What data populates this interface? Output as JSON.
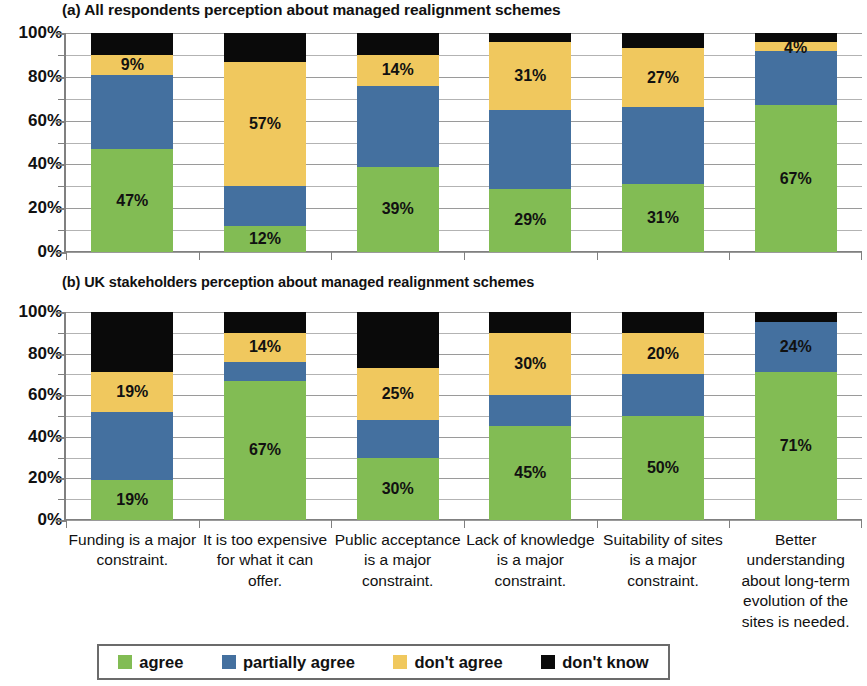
{
  "figure": {
    "panels": [
      {
        "id": "a",
        "title": "(a) All respondents perception about managed realignment schemes"
      },
      {
        "id": "b",
        "title": "(b) UK stakeholders perception about managed realignment schemes"
      }
    ]
  },
  "y_axis": {
    "ticks": [
      "0%",
      "20%",
      "40%",
      "60%",
      "80%",
      "100%"
    ],
    "minor_step": 10,
    "min": 0,
    "max": 100
  },
  "legend": {
    "position": "bottom",
    "items": [
      {
        "label": "agree",
        "color": "#82BC54",
        "key": "agree"
      },
      {
        "label": "partially agree",
        "color": "#44709F",
        "key": "partially_agree"
      },
      {
        "label": "don't agree",
        "color": "#F0C85E",
        "key": "dont_agree"
      },
      {
        "label": "don't know",
        "color": "#0A0A0A",
        "key": "dont_know"
      }
    ]
  },
  "categories": [
    "Funding is a major constraint.",
    "It is too expensive for what it can offer.",
    "Public acceptance is a major constraint.",
    "Lack of knowledge is a major constraint.",
    "Suitability of sites is a major constraint.",
    "Better understanding about long-term evolution of the sites is needed."
  ],
  "chart_data": [
    {
      "type": "bar",
      "subtype": "stacked-100-percent",
      "panel": "a",
      "title": "(a) All respondents perception about managed realignment schemes",
      "xlabel": "",
      "ylabel": "",
      "ylim": [
        0,
        100
      ],
      "ytick_labels": [
        "0%",
        "20%",
        "40%",
        "60%",
        "80%",
        "100%"
      ],
      "grid": true,
      "legend_position": "bottom",
      "categories": [
        "Funding is a major constraint.",
        "It is too expensive for what it can offer.",
        "Public acceptance is a major constraint.",
        "Lack of knowledge is a major constraint.",
        "Suitability of sites is a major constraint.",
        "Better understanding about long-term evolution of the sites is needed."
      ],
      "series": [
        {
          "name": "agree",
          "color": "#82BC54",
          "values": [
            47,
            12,
            39,
            29,
            31,
            67
          ],
          "labels": [
            "47%",
            "12%",
            "39%",
            "29%",
            "31%",
            "67%"
          ]
        },
        {
          "name": "partially agree",
          "color": "#44709F",
          "values": [
            34,
            18,
            37,
            36,
            35,
            25
          ],
          "labels": [
            "",
            "",
            "",
            "",
            "",
            ""
          ]
        },
        {
          "name": "don't agree",
          "color": "#F0C85E",
          "values": [
            9,
            57,
            14,
            31,
            27,
            4
          ],
          "labels": [
            "9%",
            "57%",
            "14%",
            "31%",
            "27%",
            "4%"
          ]
        },
        {
          "name": "don't know",
          "color": "#0A0A0A",
          "values": [
            10,
            13,
            10,
            4,
            7,
            4
          ],
          "labels": [
            "",
            "",
            "",
            "",
            "",
            ""
          ]
        }
      ]
    },
    {
      "type": "bar",
      "subtype": "stacked-100-percent",
      "panel": "b",
      "title": "(b) UK stakeholders perception about managed realignment schemes",
      "xlabel": "",
      "ylabel": "",
      "ylim": [
        0,
        100
      ],
      "ytick_labels": [
        "0%",
        "20%",
        "40%",
        "60%",
        "80%",
        "100%"
      ],
      "grid": true,
      "legend_position": "bottom",
      "categories": [
        "Funding is a major constraint.",
        "It is too expensive for what it can offer.",
        "Public acceptance is a major constraint.",
        "Lack of knowledge is a major constraint.",
        "Suitability of sites is a major constraint.",
        "Better understanding about long-term evolution of the sites is needed."
      ],
      "series": [
        {
          "name": "agree",
          "color": "#82BC54",
          "values": [
            19,
            67,
            30,
            45,
            50,
            71
          ],
          "labels": [
            "19%",
            "67%",
            "30%",
            "45%",
            "50%",
            "71%"
          ]
        },
        {
          "name": "partially agree",
          "color": "#44709F",
          "values": [
            33,
            9,
            18,
            15,
            20,
            24
          ],
          "labels": [
            "",
            "",
            "",
            "",
            "",
            "24%"
          ]
        },
        {
          "name": "don't agree",
          "color": "#F0C85E",
          "values": [
            19,
            14,
            25,
            30,
            20,
            0
          ],
          "labels": [
            "19%",
            "14%",
            "25%",
            "30%",
            "20%",
            ""
          ]
        },
        {
          "name": "don't know",
          "color": "#0A0A0A",
          "values": [
            29,
            10,
            27,
            10,
            10,
            5
          ],
          "labels": [
            "",
            "",
            "",
            "",
            "",
            ""
          ]
        }
      ]
    }
  ]
}
